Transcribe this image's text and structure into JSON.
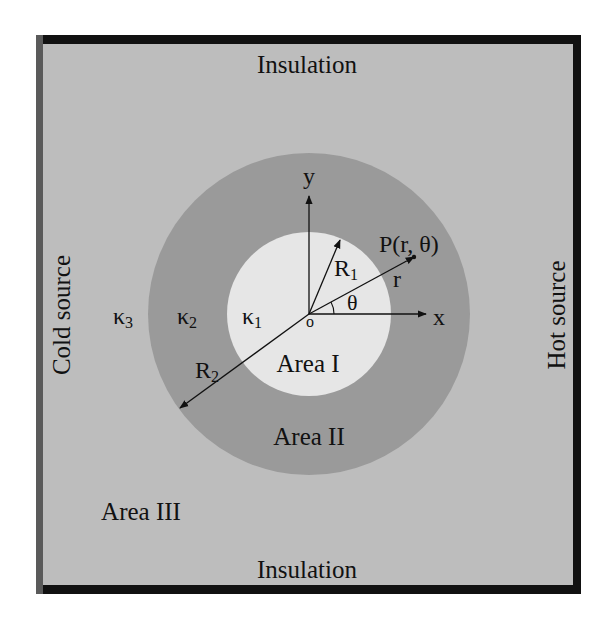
{
  "labels": {
    "top": "Insulation",
    "bottom": "Insulation",
    "left": "Cold source",
    "right": "Hot source",
    "area1": "Area I",
    "area2": "Area II",
    "area3": "Area III",
    "kappa1": "κ",
    "kappa1_sub": "1",
    "kappa2": "κ",
    "kappa2_sub": "2",
    "kappa3": "κ",
    "kappa3_sub": "3",
    "R1": "R",
    "R1_sub": "1",
    "R2": "R",
    "R2_sub": "2",
    "point": "P(r, θ)",
    "r": "r",
    "theta": "θ",
    "x_axis": "x",
    "y_axis": "y",
    "origin": "o"
  },
  "colors": {
    "background": "#bdbdbd",
    "outer_ring": "#9a9a9a",
    "inner_disk": "#e6e6e6",
    "border_dark": "#111111",
    "border_left": "#5a5a5a",
    "ink": "#111111"
  }
}
